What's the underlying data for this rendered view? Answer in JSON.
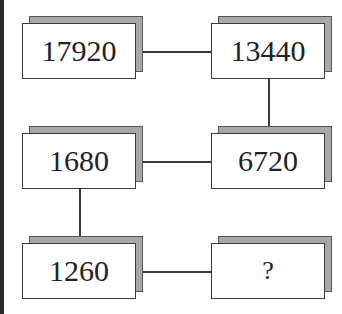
{
  "puzzle": {
    "nodes": [
      {
        "id": "r1c1",
        "value": "17920"
      },
      {
        "id": "r1c2",
        "value": "13440"
      },
      {
        "id": "r2c1",
        "value": "1680"
      },
      {
        "id": "r2c2",
        "value": "6720"
      },
      {
        "id": "r3c1",
        "value": "1260"
      },
      {
        "id": "r3c2",
        "value": "?"
      }
    ],
    "connections": [
      [
        "r1c1",
        "r1c2"
      ],
      [
        "r1c2",
        "r2c2"
      ],
      [
        "r2c2",
        "r2c1"
      ],
      [
        "r2c1",
        "r3c1"
      ],
      [
        "r3c1",
        "r3c2"
      ]
    ],
    "colors": {
      "border": "#3a3a3a",
      "shadow": "#a8a8a8",
      "background": "#ffffff"
    }
  }
}
